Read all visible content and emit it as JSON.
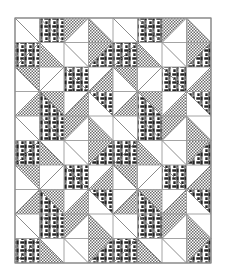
{
  "figure": {
    "kind": "quilt-pattern-diagram",
    "title": "Pieced quilt layout diagram",
    "description": "Black and white line drawing of a pieced quilt top composed of square units split into half-square triangles, arranged in a repeating pinwheel block.",
    "canvas_width": 225,
    "canvas_height": 279,
    "background_color": "#ffffff"
  },
  "quilt": {
    "origin_x": 15,
    "origin_y": 18,
    "grid_width": 196,
    "grid_height": 245,
    "columns": 8,
    "rows": 10,
    "cell_width": 24.5,
    "cell_height": 24.5,
    "outer_border_color": "#8a8a8a",
    "outer_border_width": 1.2,
    "grid_line_color": "#9a9a9a",
    "grid_line_width": 0.9,
    "diagonal_line_color": "#6e6e6e",
    "diagonal_line_width": 0.8
  },
  "fabrics": [
    {
      "key": "plain",
      "label": "Background (unprinted white)",
      "color": "#ffffff",
      "texture": "none"
    },
    {
      "key": "light",
      "label": "Light print (fine checkerboard dot)",
      "color": "#c9c9c9",
      "texture": "checker-dot"
    },
    {
      "key": "dark",
      "label": "Dark print (interlaced basket weave)",
      "color": "#2b2b2b",
      "texture": "basket-weave"
    }
  ],
  "legend_visible": false,
  "cells": [
    [
      [
        "plain",
        "plain"
      ],
      [
        "dark",
        "dark"
      ],
      [
        "light",
        "plain"
      ],
      [
        "plain",
        "light"
      ],
      [
        "plain",
        "plain"
      ],
      [
        "dark",
        "dark"
      ],
      [
        "light",
        "plain"
      ],
      [
        "plain",
        "light"
      ]
    ],
    [
      [
        "dark",
        "dark"
      ],
      [
        "plain",
        "light"
      ],
      [
        "plain",
        "plain"
      ],
      [
        "light",
        "dark"
      ],
      [
        "dark",
        "dark"
      ],
      [
        "plain",
        "light"
      ],
      [
        "plain",
        "plain"
      ],
      [
        "light",
        "dark"
      ]
    ],
    [
      [
        "light",
        "plain"
      ],
      [
        "plain",
        "plain"
      ],
      [
        "dark",
        "dark"
      ],
      [
        "plain",
        "light"
      ],
      [
        "light",
        "plain"
      ],
      [
        "plain",
        "plain"
      ],
      [
        "dark",
        "dark"
      ],
      [
        "plain",
        "light"
      ]
    ],
    [
      [
        "plain",
        "light"
      ],
      [
        "light",
        "dark"
      ],
      [
        "plain",
        "light"
      ],
      [
        "dark",
        "plain"
      ],
      [
        "plain",
        "light"
      ],
      [
        "light",
        "dark"
      ],
      [
        "plain",
        "light"
      ],
      [
        "dark",
        "plain"
      ]
    ],
    [
      [
        "plain",
        "plain"
      ],
      [
        "dark",
        "dark"
      ],
      [
        "light",
        "plain"
      ],
      [
        "plain",
        "light"
      ],
      [
        "plain",
        "plain"
      ],
      [
        "dark",
        "dark"
      ],
      [
        "light",
        "plain"
      ],
      [
        "plain",
        "light"
      ]
    ],
    [
      [
        "dark",
        "dark"
      ],
      [
        "plain",
        "light"
      ],
      [
        "plain",
        "plain"
      ],
      [
        "light",
        "dark"
      ],
      [
        "dark",
        "dark"
      ],
      [
        "plain",
        "light"
      ],
      [
        "plain",
        "plain"
      ],
      [
        "light",
        "dark"
      ]
    ],
    [
      [
        "light",
        "plain"
      ],
      [
        "plain",
        "plain"
      ],
      [
        "dark",
        "dark"
      ],
      [
        "plain",
        "light"
      ],
      [
        "light",
        "plain"
      ],
      [
        "plain",
        "plain"
      ],
      [
        "dark",
        "dark"
      ],
      [
        "plain",
        "light"
      ]
    ],
    [
      [
        "plain",
        "light"
      ],
      [
        "light",
        "dark"
      ],
      [
        "plain",
        "light"
      ],
      [
        "dark",
        "plain"
      ],
      [
        "plain",
        "light"
      ],
      [
        "light",
        "dark"
      ],
      [
        "plain",
        "light"
      ],
      [
        "dark",
        "plain"
      ]
    ],
    [
      [
        "plain",
        "plain"
      ],
      [
        "dark",
        "dark"
      ],
      [
        "light",
        "plain"
      ],
      [
        "plain",
        "light"
      ],
      [
        "plain",
        "plain"
      ],
      [
        "dark",
        "dark"
      ],
      [
        "light",
        "plain"
      ],
      [
        "plain",
        "light"
      ]
    ],
    [
      [
        "dark",
        "dark"
      ],
      [
        "plain",
        "light"
      ],
      [
        "plain",
        "plain"
      ],
      [
        "light",
        "dark"
      ],
      [
        "dark",
        "dark"
      ],
      [
        "plain",
        "light"
      ],
      [
        "plain",
        "plain"
      ],
      [
        "light",
        "dark"
      ]
    ]
  ],
  "diagonals": [
    [
      "nw-se",
      "nw-se",
      "ne-sw",
      "nw-se",
      "nw-se",
      "nw-se",
      "ne-sw",
      "nw-se"
    ],
    [
      "ne-sw",
      "nw-se",
      "nw-se",
      "ne-sw",
      "ne-sw",
      "nw-se",
      "nw-se",
      "ne-sw"
    ],
    [
      "nw-se",
      "ne-sw",
      "nw-se",
      "ne-sw",
      "nw-se",
      "ne-sw",
      "nw-se",
      "ne-sw"
    ],
    [
      "ne-sw",
      "nw-se",
      "ne-sw",
      "nw-se",
      "ne-sw",
      "nw-se",
      "ne-sw",
      "nw-se"
    ],
    [
      "nw-se",
      "nw-se",
      "ne-sw",
      "nw-se",
      "nw-se",
      "nw-se",
      "ne-sw",
      "nw-se"
    ],
    [
      "ne-sw",
      "nw-se",
      "nw-se",
      "ne-sw",
      "ne-sw",
      "nw-se",
      "nw-se",
      "ne-sw"
    ],
    [
      "nw-se",
      "ne-sw",
      "nw-se",
      "ne-sw",
      "nw-se",
      "ne-sw",
      "nw-se",
      "ne-sw"
    ],
    [
      "ne-sw",
      "nw-se",
      "ne-sw",
      "nw-se",
      "ne-sw",
      "nw-se",
      "ne-sw",
      "nw-se"
    ],
    [
      "nw-se",
      "nw-se",
      "ne-sw",
      "nw-se",
      "nw-se",
      "nw-se",
      "ne-sw",
      "nw-se"
    ],
    [
      "ne-sw",
      "nw-se",
      "nw-se",
      "ne-sw",
      "ne-sw",
      "nw-se",
      "nw-se",
      "ne-sw"
    ]
  ]
}
